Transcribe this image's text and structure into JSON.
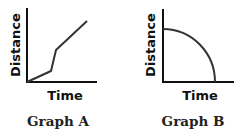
{
  "graphs": [
    {
      "caption": "Graph A",
      "xlabel": "Time",
      "ylabel": "Distance",
      "description": "Piecewise linear: shallow rise, steep rise, then moderate rise",
      "line_points": [
        [
          0,
          0
        ],
        [
          0.34,
          0.2
        ],
        [
          0.41,
          0.58
        ],
        [
          0.86,
          1.0
        ]
      ]
    },
    {
      "caption": "Graph B",
      "xlabel": "Time",
      "ylabel": "Distance",
      "description": "Concave-down quarter-circle arc decreasing from a positive distance to zero",
      "curve": "quarter-ellipse from (0, 0.72) to (0.73, 0)"
    }
  ],
  "colors": {
    "line": "#333333",
    "axis": "#111111",
    "text": "#111111"
  }
}
